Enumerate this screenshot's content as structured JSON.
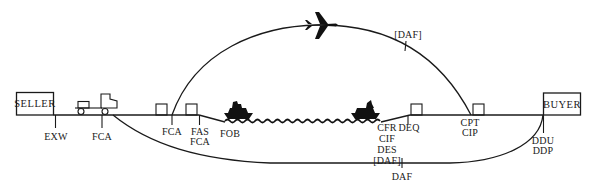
{
  "diagram": {
    "parties": {
      "seller": "SELLER",
      "buyer": "BUYER"
    },
    "ground_labels": {
      "exw": "EXW",
      "fca_truck": "FCA",
      "fca_terminal": "FCA",
      "fas": "FAS",
      "fas_fca": "FCA",
      "fob": "FOB",
      "cfr": "CFR",
      "cif": "CIF",
      "des": "DES",
      "des_daf": "[DAF]",
      "deq": "DEQ",
      "cpt": "CPT",
      "cip": "CIP",
      "ddu": "DDU",
      "ddp": "DDP"
    },
    "air_route": {
      "label": "[DAF]"
    },
    "land_route": {
      "label": "DAF"
    },
    "icons": [
      "truck-icon",
      "airplane-icon",
      "ship-icon",
      "ship-icon",
      "container-icon",
      "sea-waves-icon"
    ]
  }
}
